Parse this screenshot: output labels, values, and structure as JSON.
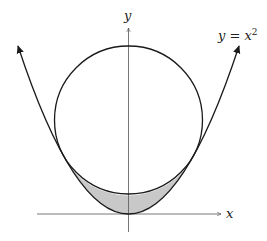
{
  "figure": {
    "axes": {
      "x_label": "x",
      "y_label": "y"
    },
    "curve_label": {
      "base": "y = x",
      "exponent": "2"
    },
    "shapes": {
      "parabola": "y = x^2",
      "circle": "tangent to parabola at two points",
      "shaded_region": "between parabola and lower arc of circle"
    },
    "colors": {
      "curve": "#1a1a1a",
      "axis": "#555555",
      "shade": "#c8c8c8"
    }
  }
}
